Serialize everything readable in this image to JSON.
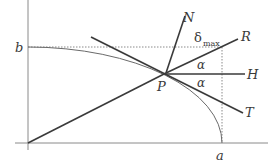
{
  "diagram": {
    "labels": {
      "b": "b",
      "a": "a",
      "P": "P",
      "N": "N",
      "R": "R",
      "H": "H",
      "T": "T",
      "alpha_upper": "α",
      "alpha_lower": "α",
      "delta": "δ",
      "delta_sub": "max"
    },
    "colors": {
      "axes": "#8a8a8a",
      "lines": "#3a3a3a",
      "curve": "#6a6a6a",
      "dotted": "#8a8a8a",
      "text": "#3a3a3a"
    }
  }
}
